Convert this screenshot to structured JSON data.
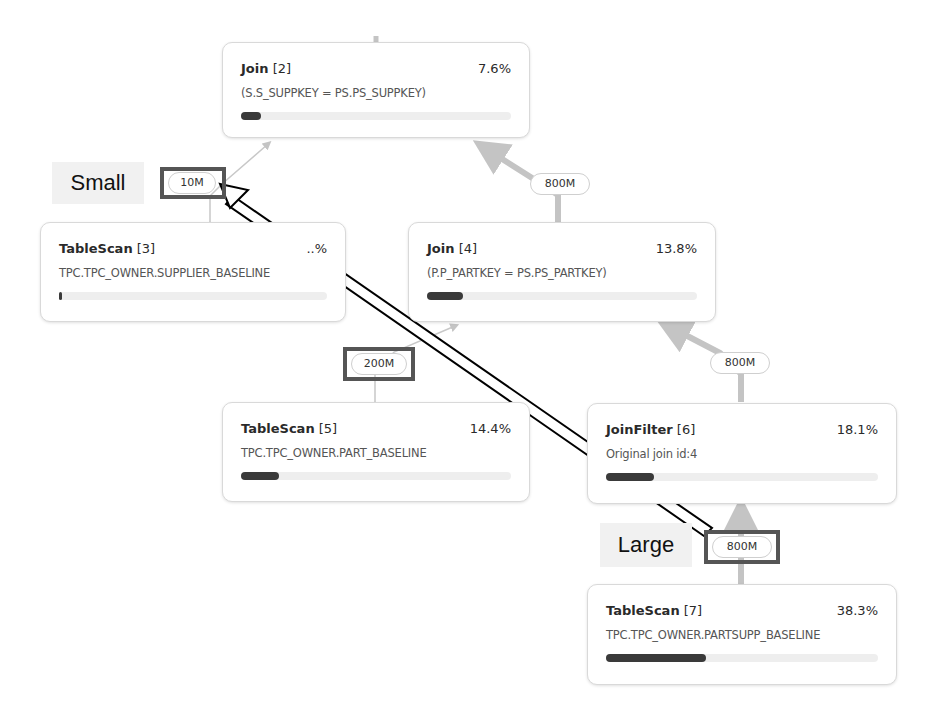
{
  "nodes": [
    {
      "id": "join-2",
      "name": "Join",
      "index": "[2]",
      "percent": "7.6%",
      "detail": "(S.S_SUPPKEY = PS.PS_SUPPKEY)",
      "bar_fill_pct": 7.6
    },
    {
      "id": "tablescan-3",
      "name": "TableScan",
      "index": "[3]",
      "percent": "..%",
      "detail": "TPC.TPC_OWNER.SUPPLIER_BASELINE",
      "bar_fill_pct": 1
    },
    {
      "id": "join-4",
      "name": "Join",
      "index": "[4]",
      "percent": "13.8%",
      "detail": "(P.P_PARTKEY = PS.PS_PARTKEY)",
      "bar_fill_pct": 13.8
    },
    {
      "id": "tablescan-5",
      "name": "TableScan",
      "index": "[5]",
      "percent": "14.4%",
      "detail": "TPC.TPC_OWNER.PART_BASELINE",
      "bar_fill_pct": 14.4
    },
    {
      "id": "joinfilter-6",
      "name": "JoinFilter",
      "index": "[6]",
      "percent": "18.1%",
      "detail": "Original join id:4",
      "bar_fill_pct": 18.1
    },
    {
      "id": "tablescan-7",
      "name": "TableScan",
      "index": "[7]",
      "percent": "38.3%",
      "detail": "TPC.TPC_OWNER.PARTSUPP_BASELINE",
      "bar_fill_pct": 38.3
    }
  ],
  "edges": [
    {
      "from": "tablescan-3",
      "to": "join-2",
      "rows": "10M",
      "highlighted": true
    },
    {
      "from": "join-4",
      "to": "join-2",
      "rows": "800M",
      "highlighted": false
    },
    {
      "from": "tablescan-5",
      "to": "join-4",
      "rows": "200M",
      "highlighted": true
    },
    {
      "from": "joinfilter-6",
      "to": "join-4",
      "rows": "800M",
      "highlighted": false
    },
    {
      "from": "tablescan-7",
      "to": "joinfilter-6",
      "rows": "800M",
      "highlighted": true
    }
  ],
  "annotations": {
    "small_label": "Small",
    "large_label": "Large",
    "arrow": "from Large (800M) to Small (10M)"
  },
  "colors": {
    "edge": "#c4c4c4",
    "bar_fill": "#3a3a3a",
    "bar_track": "#eeeeee",
    "highlight_box": "#555555",
    "tag_bg": "#f1f1f1"
  }
}
